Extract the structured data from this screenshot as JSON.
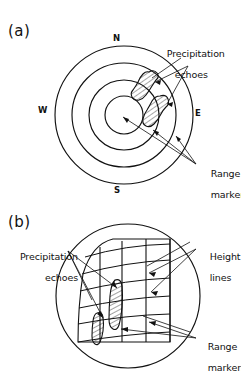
{
  "figure": {
    "type": "radar-display-schematic",
    "background": "#ffffff",
    "ink": "#111111"
  },
  "panels": [
    {
      "id": "a",
      "tag": "(a)",
      "display_type": "PPI",
      "compass": {
        "north": "N",
        "east": "E",
        "south": "S",
        "west": "W"
      },
      "range_rings": 4,
      "annotations": [
        {
          "id": "precip-a",
          "line1": "Precipitation",
          "line2": "echoes"
        },
        {
          "id": "range-a",
          "line1": "Range",
          "line2": "markers"
        }
      ],
      "echo_count": 2
    },
    {
      "id": "b",
      "tag": "(b)",
      "display_type": "RHI",
      "annotations": [
        {
          "id": "precip-b",
          "line1": "Precipitation",
          "line2": "echoes"
        },
        {
          "id": "height-b",
          "line1": "Height",
          "line2": "lines"
        },
        {
          "id": "range-b",
          "line1": "Range",
          "line2": "markers"
        }
      ],
      "height_lines": 6,
      "range_markers": 4,
      "echo_count": 2
    }
  ]
}
